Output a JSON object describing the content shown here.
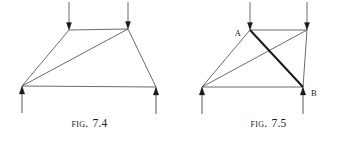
{
  "page": {
    "background_color": "#ffffff",
    "ink_color": "#3a3a3a",
    "bold_ink_color": "#1a1a1a",
    "width": 358,
    "height": 143
  },
  "figures": [
    {
      "id": "fig-7-4",
      "caption_prefix": "Fig.",
      "caption_number": "7.4",
      "description": "Trapezoidal truss with two downward load arrows on the top chord, two upward reaction arrows at the supports, and one diagonal from the bottom-left support to the top-right joint.",
      "node_labels": [],
      "nodes": {
        "top_left": {
          "x": 69,
          "y": 30
        },
        "top_right": {
          "x": 128,
          "y": 29
        },
        "bottom_left": {
          "x": 22,
          "y": 86
        },
        "bottom_right": {
          "x": 156,
          "y": 87
        }
      },
      "members": [
        {
          "name": "top-chord",
          "from": "top_left",
          "to": "top_right",
          "weight": "thin"
        },
        {
          "name": "left-chord",
          "from": "top_left",
          "to": "bottom_left",
          "weight": "thin"
        },
        {
          "name": "right-chord",
          "from": "top_right",
          "to": "bottom_right",
          "weight": "thin"
        },
        {
          "name": "bottom-chord",
          "from": "bottom_left",
          "to": "bottom_right",
          "weight": "thin"
        },
        {
          "name": "diagonal-bl-tr",
          "from": "bottom_left",
          "to": "top_right",
          "weight": "thin"
        }
      ],
      "loads": [
        {
          "name": "load-arrow-top-left",
          "x": 69,
          "from_y": 2,
          "to_y": 30,
          "direction": "down"
        },
        {
          "name": "load-arrow-top-right",
          "x": 128,
          "from_y": 2,
          "to_y": 29,
          "direction": "down"
        }
      ],
      "reactions": [
        {
          "name": "reaction-arrow-bottom-left",
          "x": 22,
          "from_y": 113,
          "to_y": 86,
          "direction": "up"
        },
        {
          "name": "reaction-arrow-bottom-right",
          "x": 156,
          "from_y": 114,
          "to_y": 87,
          "direction": "up"
        }
      ]
    },
    {
      "id": "fig-7-5",
      "caption_prefix": "Fig.",
      "caption_number": "7.5",
      "description": "Trapezoidal truss with two downward load arrows on the top chord, two upward reaction arrows at the supports, a thin diagonal from the bottom-left support to the top-right joint, and a bold diagonal from joint A to joint B.",
      "node_labels": [
        {
          "name": "node-label-a",
          "text": "A",
          "x": 62,
          "y": 36,
          "anchor": "end"
        },
        {
          "name": "node-label-b",
          "text": "B",
          "x": 132,
          "y": 96,
          "anchor": "start"
        }
      ],
      "nodes": {
        "top_left": {
          "x": 71,
          "y": 30
        },
        "top_right": {
          "x": 128,
          "y": 30
        },
        "bottom_left": {
          "x": 23,
          "y": 87
        },
        "bottom_right": {
          "x": 124,
          "y": 87
        }
      },
      "members": [
        {
          "name": "top-chord",
          "from": "top_left",
          "to": "top_right",
          "weight": "thin"
        },
        {
          "name": "left-chord",
          "from": "top_left",
          "to": "bottom_left",
          "weight": "thin"
        },
        {
          "name": "right-chord",
          "from": "top_right",
          "to": "bottom_right",
          "weight": "thin"
        },
        {
          "name": "bottom-chord",
          "from": "bottom_left",
          "to": "bottom_right",
          "weight": "thin"
        },
        {
          "name": "diagonal-bl-tr",
          "from": "bottom_left",
          "to": "top_right",
          "weight": "thin"
        },
        {
          "name": "diagonal-a-b",
          "from": "top_left",
          "to": "bottom_right",
          "weight": "bold"
        }
      ],
      "loads": [
        {
          "name": "load-arrow-top-left",
          "x": 71,
          "from_y": 2,
          "to_y": 30,
          "direction": "down"
        },
        {
          "name": "load-arrow-top-right",
          "x": 128,
          "from_y": 2,
          "to_y": 30,
          "direction": "down"
        }
      ],
      "reactions": [
        {
          "name": "reaction-arrow-bottom-left",
          "x": 23,
          "from_y": 114,
          "to_y": 87,
          "direction": "up"
        },
        {
          "name": "reaction-arrow-bottom-right",
          "x": 124,
          "from_y": 114,
          "to_y": 87,
          "direction": "up"
        }
      ]
    }
  ]
}
